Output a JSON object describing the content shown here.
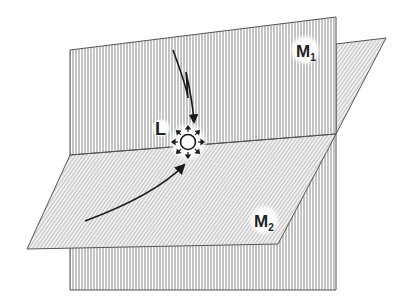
{
  "diagram": {
    "type": "two-intersecting-planes",
    "planes": [
      {
        "id": "M1",
        "label": "M",
        "subscript": "1",
        "orientation": "vertical",
        "pattern": "vertical-stripes"
      },
      {
        "id": "M2",
        "label": "M",
        "subscript": "2",
        "orientation": "sloped",
        "pattern": "diagonal-stripes"
      }
    ],
    "point": {
      "id": "L",
      "label": "L",
      "icon": "radiating-sun-icon",
      "location": "intersection-line"
    },
    "arrows": [
      {
        "from": "M1-plane",
        "to": "L",
        "style": "zigzag-curve"
      },
      {
        "from": "M2-plane",
        "to": "L",
        "style": "curve"
      }
    ],
    "colors": {
      "background": "#ffffff",
      "stripe": "#8a8a8a",
      "edge": "#555555",
      "arrow": "#1a1a1a",
      "label": "#222222"
    }
  }
}
